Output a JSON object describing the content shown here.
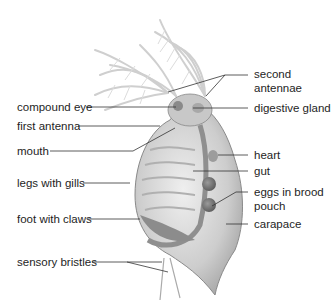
{
  "figure": {
    "colors": {
      "label_text": "#1e1e1e",
      "leader_line": "#333333",
      "body_fill": "#d6d6d6",
      "body_shade": "#a9a9a9",
      "antenna": "#cfcfcf",
      "eggs": "#7a7a7a"
    }
  },
  "labels": {
    "left": [
      {
        "id": "compound-eye",
        "text": "compound eye"
      },
      {
        "id": "first-antenna",
        "text": "first antenna"
      },
      {
        "id": "mouth",
        "text": "mouth"
      },
      {
        "id": "legs-with-gills",
        "text": "legs with gills"
      },
      {
        "id": "foot-with-claws",
        "text": "foot with claws"
      },
      {
        "id": "sensory-bristles",
        "text": "sensory bristles"
      }
    ],
    "right": [
      {
        "id": "second-antennae",
        "text": "second antennae"
      },
      {
        "id": "digestive-gland",
        "text": "digestive gland"
      },
      {
        "id": "heart",
        "text": "heart"
      },
      {
        "id": "gut",
        "text": "gut"
      },
      {
        "id": "eggs-in-brood-pouch",
        "text": "eggs in brood pouch"
      },
      {
        "id": "carapace",
        "text": "carapace"
      }
    ]
  }
}
